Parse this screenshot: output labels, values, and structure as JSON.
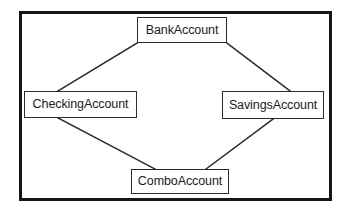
{
  "diagram": {
    "type": "uml-class-diagram",
    "relationship": "inheritance",
    "pattern": "diamond-multiple-inheritance",
    "frame": {
      "border_color": "#16161a",
      "background_color": "#ffffff"
    },
    "box_style": {
      "border_color": "#2b2b2f",
      "fill_color": "#ffffff",
      "text_color": "#1b1b1f"
    },
    "nodes": [
      {
        "id": "bankaccount",
        "label": "BankAccount",
        "role": "base-class"
      },
      {
        "id": "checkingaccount",
        "label": "CheckingAccount",
        "role": "derived-class"
      },
      {
        "id": "savingsaccount",
        "label": "SavingsAccount",
        "role": "derived-class"
      },
      {
        "id": "comboaccount",
        "label": "ComboAccount",
        "role": "derived-class"
      }
    ],
    "edges": [
      {
        "id": "edge-bank-checking",
        "from": "checkingaccount",
        "to": "bankaccount",
        "x1": 137,
        "y1": 91,
        "x2": 137,
        "y2": 43
      },
      {
        "id": "edge-bank-savings",
        "from": "savingsaccount",
        "to": "bankaccount",
        "x1": 227,
        "y1": 43,
        "x2": 275,
        "y2": 91
      },
      {
        "id": "edge-checking-combo",
        "from": "comboaccount",
        "to": "checkingaccount",
        "x1": 58,
        "y1": 118,
        "x2": 155,
        "y2": 169
      },
      {
        "id": "edge-savings-combo",
        "from": "comboaccount",
        "to": "savingsaccount",
        "x1": 206,
        "y1": 169,
        "x2": 273,
        "y2": 119
      }
    ],
    "edge_color": "#2b2b2f"
  }
}
